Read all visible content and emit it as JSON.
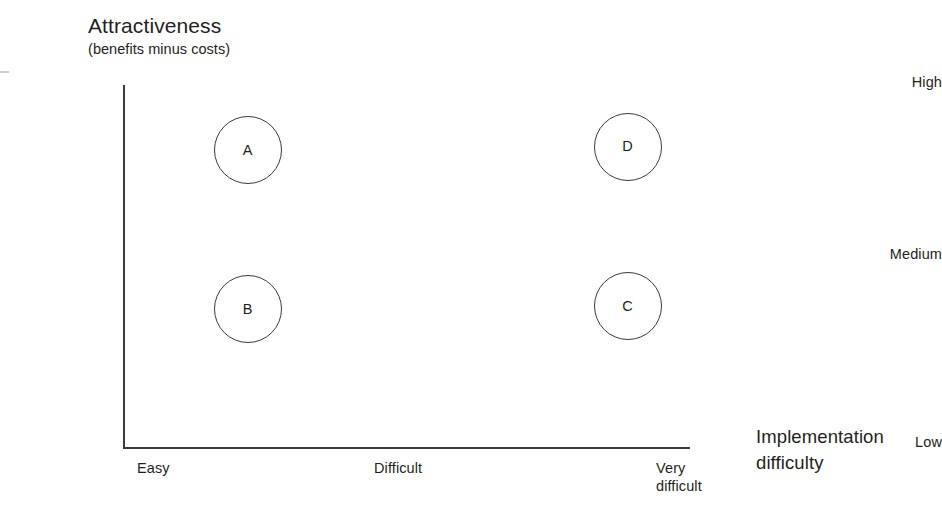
{
  "chart_data": {
    "type": "scatter",
    "title": "Attractiveness",
    "subtitle": "(benefits minus costs)",
    "ylabel": "Attractiveness (benefits minus costs)",
    "xlabel": "Implementation difficulty",
    "grid": false,
    "legend": "none",
    "y_ticks": [
      "High",
      "Medium",
      "Low"
    ],
    "x_ticks": [
      "Easy",
      "Difficult",
      "Very difficult"
    ],
    "x_categories": [
      "Easy",
      "Difficult",
      "Very difficult"
    ],
    "y_categories": [
      "Low",
      "Medium",
      "High"
    ],
    "points": [
      {
        "label": "A",
        "x": "Easy",
        "y": "High",
        "x_value": 0.22,
        "y_value": 0.82
      },
      {
        "label": "D",
        "x": "Very difficult",
        "y": "High",
        "x_value": 0.89,
        "y_value": 0.83
      },
      {
        "label": "B",
        "x": "Easy",
        "y": "Low-Medium",
        "x_value": 0.22,
        "y_value": 0.38
      },
      {
        "label": "C",
        "x": "Very difficult",
        "y": "Low-Medium",
        "x_value": 0.89,
        "y_value": 0.39
      }
    ]
  },
  "chart": {
    "y_axis": {
      "title_main": "Attractiveness",
      "title_sub": "(benefits minus costs)",
      "tick_high": "High",
      "tick_medium": "Medium",
      "tick_low": "Low"
    },
    "x_axis": {
      "title_line1": "Implementation",
      "title_line2": "difficulty",
      "tick_easy": "Easy",
      "tick_difficult": "Difficult",
      "tick_very_line1": "Very",
      "tick_very_line2": "difficult"
    },
    "bubbles": [
      {
        "label": "A"
      },
      {
        "label": "D"
      },
      {
        "label": "B"
      },
      {
        "label": "C"
      }
    ]
  },
  "colors": {
    "background": "#ffffff",
    "axis": "#3a3a3a",
    "text": "#231f20",
    "bubble_stroke": "#3a3a3a"
  }
}
